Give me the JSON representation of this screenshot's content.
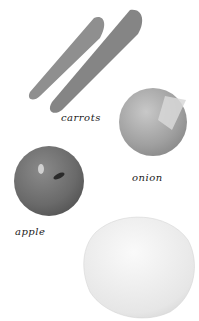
{
  "header": {
    "cut_text": "˙˙˙ ˙ ˙˙"
  },
  "items": [
    {
      "name": "carrots",
      "label": "carrots",
      "color": "#8e8e8e"
    },
    {
      "name": "onion",
      "label": "onion",
      "color": "#a9a9a9"
    },
    {
      "name": "apple",
      "label": "apple",
      "color": "#6f6f6f"
    },
    {
      "name": "cabbage",
      "label": "",
      "color": "#ececec"
    }
  ]
}
